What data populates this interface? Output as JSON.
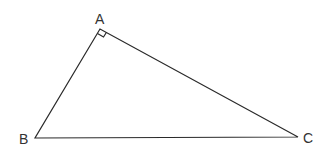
{
  "diagram": {
    "type": "right-triangle",
    "vertices": [
      {
        "label": "A",
        "x": 100,
        "y": 29,
        "label_x": 95,
        "label_y": 24
      },
      {
        "label": "B",
        "x": 35,
        "y": 138,
        "label_x": 19,
        "label_y": 144
      },
      {
        "label": "C",
        "x": 298,
        "y": 137,
        "label_x": 303,
        "label_y": 143
      }
    ],
    "right_angle_at": "A",
    "stroke_color": "#2a2a2a",
    "label_color": "#333333"
  }
}
